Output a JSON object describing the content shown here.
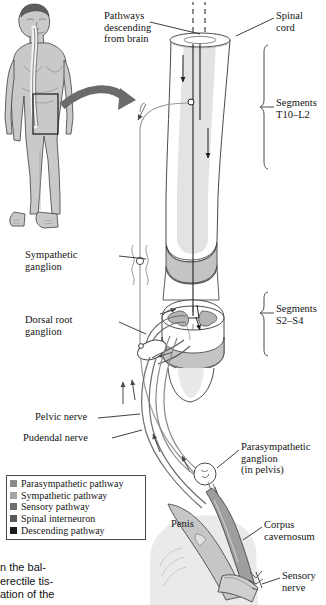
{
  "figure": {
    "kind": "anatomical-diagram",
    "labels": {
      "pathways_descending": "Pathways\ndescending\nfrom brain",
      "spinal_cord": "Spinal\ncord",
      "segments_upper": "Segments\nT10–L2",
      "segments_lower": "Segments\nS2–S4",
      "sympathetic_ganglion": "Sympathetic\nganglion",
      "dorsal_root_ganglion": "Dorsal root\nganglion",
      "pelvic_nerve": "Pelvic nerve",
      "pudendal_nerve": "Pudendal nerve",
      "parasympathetic_ganglion": "Parasympathetic\nganglion\n(in pelvis)",
      "penis": "Penis",
      "corpus_cavernosum": "Corpus\ncavernosum",
      "sensory_nerve": "Sensory\nnerve"
    }
  },
  "legend": {
    "items": [
      {
        "label": "Parasympathetic pathway",
        "color": "#8a8a8a"
      },
      {
        "label": "Sympathetic pathway",
        "color": "#a5a5a5"
      },
      {
        "label": "Sensory pathway",
        "color": "#6e6e6e"
      },
      {
        "label": "Spinal interneuron",
        "color": "#5a5a5a"
      },
      {
        "label": "Descending pathway",
        "color": "#1c1c1c"
      }
    ]
  },
  "caption_fragment": {
    "text": "n the bal-\nerectile tis-\nation of the"
  },
  "palette": {
    "ink": "#141414",
    "line": "#4a4a4a",
    "skin_fill": "#c9c9c9",
    "skin_shade": "#b0b0b0",
    "cord_fill": "#ffffff",
    "cord_band": "#c4c4c4",
    "cord_tint": "#dcdcdc",
    "gray_matter": "#b4b4b4",
    "arrow_gray": "#6b6b6b",
    "cavernosum": "#9e9e9e",
    "page_bg": "#ffffff"
  }
}
